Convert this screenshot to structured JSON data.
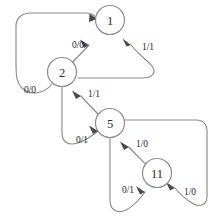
{
  "diagram": {
    "kind": "state-transition-diagram",
    "title": "",
    "canvas": {
      "width": 218,
      "height": 223,
      "background": "#ffffff"
    },
    "style": {
      "edge_color": "#8a8a8a",
      "node_stroke": "#8c8c8c",
      "node_fill": "#ffffff",
      "label_color": "#1f1f1f",
      "arrow_color": "#4a4a4a"
    },
    "nodes": [
      {
        "id": "n1",
        "label": "1",
        "cx": 110,
        "cy": 20,
        "r": 14.5
      },
      {
        "id": "n2",
        "label": "2",
        "cx": 62,
        "cy": 72,
        "r": 14.5
      },
      {
        "id": "n5",
        "label": "5",
        "cx": 110,
        "cy": 123,
        "r": 14.5
      },
      {
        "id": "n11",
        "label": "11",
        "cx": 157,
        "cy": 173,
        "r": 14.5
      }
    ],
    "edges": [
      {
        "id": "e1",
        "from": "n1",
        "to": "n2",
        "label": "0/0",
        "label_x": 78,
        "label_y": 45
      },
      {
        "id": "e2",
        "from": "n1",
        "to": "n2",
        "label": "1/1",
        "label_x": 148,
        "label_y": 47
      },
      {
        "id": "e3",
        "from": "n2",
        "to": "n1",
        "label": "0/0",
        "label_x": 30,
        "label_y": 90
      },
      {
        "id": "e4",
        "from": "n2",
        "to": "n5",
        "label": "1/1",
        "label_x": 94,
        "label_y": 94
      },
      {
        "id": "e5",
        "from": "n2",
        "to": "n5",
        "label": "0/1",
        "label_x": 82,
        "label_y": 140
      },
      {
        "id": "e6",
        "from": "n5",
        "to": "n11",
        "label": "1/0",
        "label_x": 142,
        "label_y": 144
      },
      {
        "id": "e7",
        "from": "n5",
        "to": "n11",
        "label": "1/0",
        "label_x": 190,
        "label_y": 192
      },
      {
        "id": "e8",
        "from": "n5",
        "to": "n11",
        "label": "0/1",
        "label_x": 128,
        "label_y": 190
      }
    ]
  }
}
